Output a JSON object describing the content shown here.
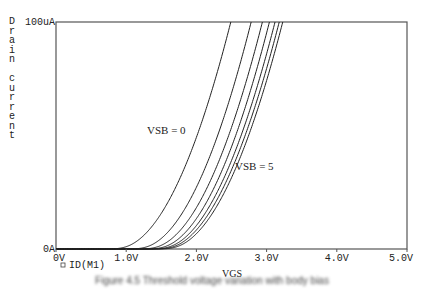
{
  "chart_data": {
    "type": "line",
    "title": "",
    "xlabel": "VGS",
    "ylabel": "Drain current",
    "xlim": [
      0,
      5
    ],
    "ylim": [
      0,
      100
    ],
    "x_ticks": [
      "0V",
      "1.0V",
      "2.0V",
      "3.0V",
      "4.0V",
      "5.0V"
    ],
    "y_ticks": [
      "0A",
      "100uA"
    ],
    "legend": {
      "marker": "square",
      "label": "ID(M1)",
      "placement": "bottom-left"
    },
    "annotations": [
      {
        "text": "VSB = 0",
        "anchor": "curve-1"
      },
      {
        "text": "VSB = 5",
        "anchor": "curve-7"
      }
    ],
    "series": [
      {
        "name": "VSB=0",
        "vt": 0.85,
        "v_at_100uA": 2.49
      },
      {
        "name": "VSB=1",
        "vt": 1.15,
        "v_at_100uA": 2.78
      },
      {
        "name": "VSB=2",
        "vt": 1.3,
        "v_at_100uA": 2.94
      },
      {
        "name": "VSB=3",
        "vt": 1.4,
        "v_at_100uA": 3.04
      },
      {
        "name": "VSB=4",
        "vt": 1.47,
        "v_at_100uA": 3.12
      },
      {
        "name": "VSB=4.5",
        "vt": 1.52,
        "v_at_100uA": 3.18
      },
      {
        "name": "VSB=5",
        "vt": 1.57,
        "v_at_100uA": 3.23
      }
    ],
    "units": {
      "x": "V",
      "y": "uA"
    }
  },
  "caption": "Figure 4.5 Threshold voltage variation with body bias"
}
